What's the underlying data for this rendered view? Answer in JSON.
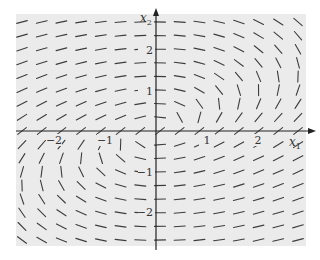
{
  "chart_data": {
    "type": "direction_field",
    "title": "",
    "xlabel": "x1",
    "ylabel": "x2",
    "xlim": [
      -2.7,
      2.9
    ],
    "ylim": [
      -2.9,
      2.9
    ],
    "x_ticks": [
      -2,
      -1,
      1,
      2
    ],
    "y_ticks": [
      -2,
      -1,
      1,
      2
    ],
    "x_tick_labels": [
      "−2",
      "−1",
      "1",
      "2"
    ],
    "y_tick_labels": [
      "−2",
      "−1",
      "1",
      "2"
    ],
    "grid": false,
    "field_description": "Slope segments of a planar linear system; approx direction (dx1, dx2) = (2*x2 - x1, -x1)",
    "field_grid": {
      "nx": 15,
      "ny": 17
    },
    "background": "#ebebeb",
    "segment_color": "#3c3c3c"
  },
  "axes": {
    "x_label_main": "x",
    "x_label_sub": "1",
    "y_label_main": "x",
    "y_label_sub": "2"
  }
}
